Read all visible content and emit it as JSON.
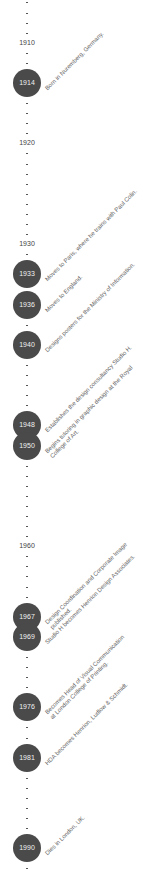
{
  "timeline": {
    "start_year": 1906,
    "end_year": 1992,
    "y_origin_year": 1914,
    "y_origin_px": 83,
    "px_per_year": 10.07,
    "decades": [
      "1910",
      "1920",
      "1930",
      "1960"
    ],
    "events": [
      {
        "year": 1914,
        "label": "Born in Nuremberg, Germany."
      },
      {
        "year": 1933,
        "label": "Moves to Paris, where he trains with Paul Colin."
      },
      {
        "year": 1936,
        "label": "Moves to England."
      },
      {
        "year": 1940,
        "label": "Designs posters for the Ministry of Information."
      },
      {
        "year": 1948,
        "label": "Establishes the design consultancy Studio H."
      },
      {
        "year": 1950,
        "label": "Begins tutoring in graphic design at the Royal\nCollege of Art."
      },
      {
        "year": 1967,
        "label": "Design Coordination and Corporate Image\npublished."
      },
      {
        "year": 1969,
        "label": "Studio H becomes Henrion Design Associates."
      },
      {
        "year": 1976,
        "label": "Becomes Head of Visual Communication\nat London College of Printing."
      },
      {
        "year": 1981,
        "label": "HDA becomes Henrion, Ludlow & Schmidt."
      },
      {
        "year": 1990,
        "label": "Dies in London, UK."
      }
    ],
    "colors": {
      "dot": "#4a4a4a",
      "dot_text": "#f0f0f0",
      "label_text": "#666666",
      "tick": "#555555"
    }
  }
}
